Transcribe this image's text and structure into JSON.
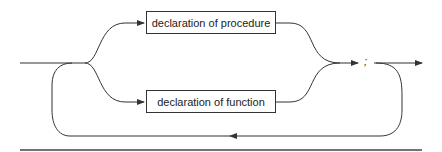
{
  "diagram": {
    "type": "syntax-diagram",
    "nodes": [
      {
        "id": "procedure",
        "label": "declaration of procedure"
      },
      {
        "id": "function",
        "label": "declaration of function"
      },
      {
        "id": "semicolon",
        "label": ";"
      }
    ],
    "edges": [
      {
        "from": "entry",
        "to": "procedure"
      },
      {
        "from": "entry",
        "to": "function"
      },
      {
        "from": "procedure",
        "to": "semicolon"
      },
      {
        "from": "function",
        "to": "semicolon"
      },
      {
        "from": "semicolon",
        "to": "exit"
      },
      {
        "from": "semicolon",
        "to": "entry",
        "label": "loop-back"
      }
    ],
    "colors": {
      "line": "#333333",
      "background": "#ffffff"
    }
  }
}
